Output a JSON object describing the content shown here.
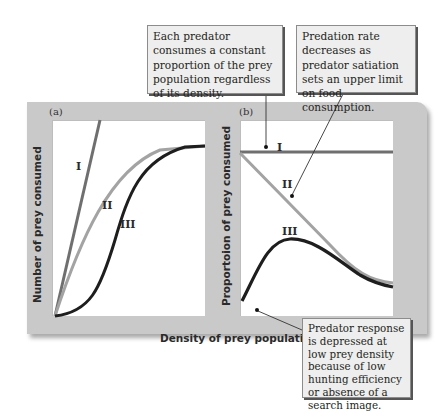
{
  "figure": {
    "panel_a": {
      "label": "(a)",
      "ylabel": "Number of prey consumed",
      "curve_labels": [
        "I",
        "II",
        "III"
      ]
    },
    "panel_b": {
      "label": "(b)",
      "ylabel": "Proportoion of prey consumed",
      "curve_labels": [
        "I",
        "II",
        "III"
      ]
    },
    "xlabel": "Density of prey population"
  },
  "callouts": {
    "type1": "Each predator consumes a constant proportion of the prey population regardless of its density.",
    "type2": "Predation rate decreases as predator satiation sets an upper limit on food consumption.",
    "type3": "Predator response is depressed at low prey density because of low hunting efficiency or absence of a search image."
  },
  "colors": {
    "frame": "#c9c9c9",
    "plot_bg": "#ffffff",
    "type1": "#6f6f6f",
    "type2": "#a3a3a3",
    "type3": "#1e1e1e",
    "callout_bg": "#eeeeee"
  }
}
